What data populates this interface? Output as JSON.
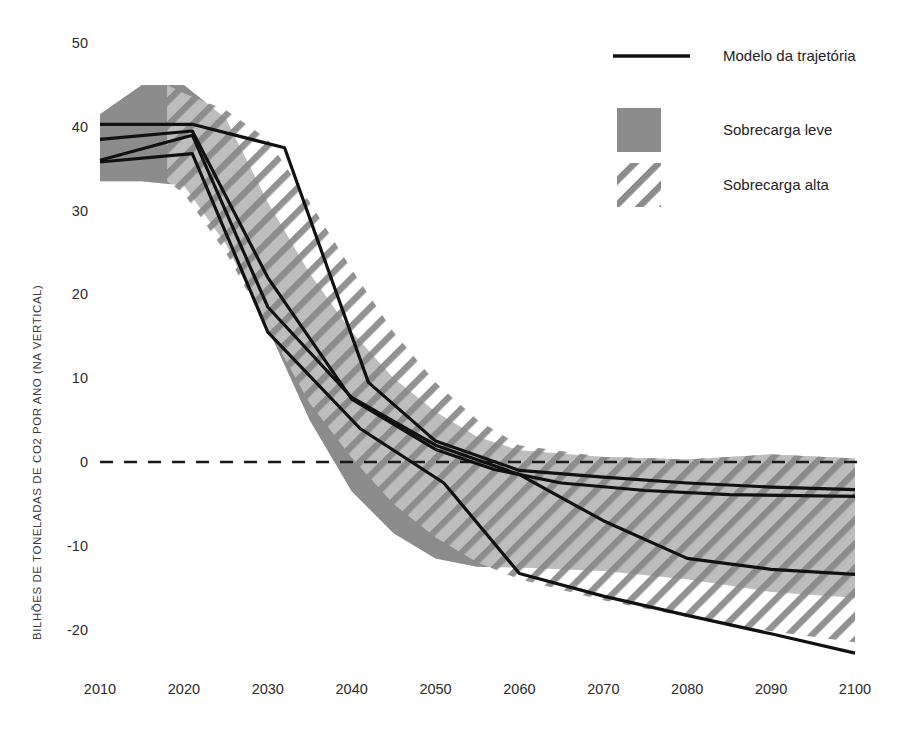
{
  "chart_data": {
    "type": "area",
    "title": "",
    "xlabel": "",
    "ylabel": "BILHÕES DE TONELADAS DE CO2 POR ANO (NA VERTICAL)",
    "xlim": [
      2010,
      2100
    ],
    "ylim": [
      -25,
      50
    ],
    "xticks": [
      "2010",
      "2020",
      "2030",
      "2040",
      "2050",
      "2060",
      "2070",
      "2080",
      "2090",
      "2100"
    ],
    "yticks": [
      "50",
      "40",
      "30",
      "20",
      "10",
      "0",
      "-10",
      "-20"
    ],
    "ytick_values": [
      50,
      40,
      30,
      20,
      10,
      0,
      -10,
      -20
    ],
    "xtick_values": [
      2010,
      2020,
      2030,
      2040,
      2050,
      2060,
      2070,
      2080,
      2090,
      2100
    ],
    "grid": false,
    "zero_line": {
      "value": 0,
      "style": "dashed",
      "color": "#1a1a1a"
    },
    "legend_position": "top-right",
    "x": [
      2010,
      2020,
      2030,
      2040,
      2050,
      2060,
      2070,
      2080,
      2090,
      2100
    ],
    "bands": [
      {
        "name": "Sobrecarga leve",
        "style": "solid-fill",
        "color": "#8c8c8c",
        "x": [
          2010,
          2015,
          2020,
          2025,
          2030,
          2035,
          2040,
          2045,
          2050,
          2055,
          2060,
          2070,
          2080,
          2090,
          2100
        ],
        "upper": [
          41.5,
          45.0,
          45.0,
          41.0,
          31.0,
          22.5,
          15.5,
          10.0,
          6.0,
          3.0,
          1.4,
          0.6,
          0.3,
          0.9,
          0.4
        ],
        "lower": [
          33.5,
          33.5,
          33.0,
          26.0,
          16.0,
          5.0,
          -3.5,
          -8.5,
          -11.5,
          -12.5,
          -12.6,
          -13.0,
          -14.0,
          -15.5,
          -16.2
        ]
      },
      {
        "name": "Sobrecarga alta",
        "style": "diagonal-hatch",
        "color": "#8c8c8c",
        "x": [
          2018,
          2020,
          2025,
          2030,
          2035,
          2040,
          2045,
          2050,
          2055,
          2060,
          2070,
          2080,
          2090,
          2100
        ],
        "upper": [
          45.0,
          44.0,
          42.0,
          38.5,
          31.0,
          23.0,
          15.5,
          9.5,
          5.0,
          2.0,
          0.6,
          0.3,
          0.9,
          0.4
        ],
        "lower": [
          33.5,
          32.0,
          25.0,
          16.0,
          7.0,
          0.5,
          -5.0,
          -9.0,
          -12.0,
          -14.0,
          -16.5,
          -18.5,
          -20.2,
          -21.5
        ]
      }
    ],
    "series": [
      {
        "name": "Modelo da trajetória",
        "style": "solid-line",
        "color": "#111111",
        "x": [
          2010,
          2021,
          2032,
          2042,
          2050,
          2060,
          2070,
          2080,
          2090,
          2100
        ],
        "y": [
          40.3,
          40.3,
          37.5,
          9.5,
          2.5,
          -1.0,
          -1.8,
          -2.5,
          -3.0,
          -3.3
        ]
      },
      {
        "name": "Modelo da trajetória",
        "style": "solid-line",
        "color": "#111111",
        "x": [
          2010,
          2021,
          2030,
          2040,
          2050,
          2057,
          2065,
          2075,
          2085,
          2100
        ],
        "y": [
          38.5,
          39.5,
          22.0,
          7.5,
          1.5,
          -0.9,
          -2.5,
          -3.4,
          -3.9,
          -4.1
        ]
      },
      {
        "name": "Modelo da trajetória",
        "style": "solid-line",
        "color": "#111111",
        "x": [
          2010,
          2021,
          2030,
          2040,
          2050,
          2060,
          2070,
          2080,
          2090,
          2100
        ],
        "y": [
          36.0,
          39.0,
          18.5,
          7.7,
          2.0,
          -1.5,
          -7.0,
          -11.5,
          -12.8,
          -13.4
        ]
      },
      {
        "name": "Modelo da trajetória",
        "style": "solid-line",
        "color": "#111111",
        "x": [
          2010,
          2021,
          2030,
          2041,
          2051,
          2060,
          2070,
          2080,
          2090,
          2100
        ],
        "y": [
          35.8,
          36.8,
          15.5,
          4.0,
          -2.5,
          -13.3,
          -16.0,
          -18.3,
          -20.5,
          -22.8
        ]
      }
    ],
    "legend": [
      {
        "label": "Modelo da trajetória",
        "swatch": "line"
      },
      {
        "label": "Sobrecarga leve",
        "swatch": "fill"
      },
      {
        "label": "Sobrecarga alta",
        "swatch": "hatch"
      }
    ],
    "colors": {
      "band_fill": "#8c8c8c",
      "hatch": "#8c8c8c",
      "line": "#111111",
      "text": "#2b2b2b",
      "background": "#ffffff"
    }
  }
}
